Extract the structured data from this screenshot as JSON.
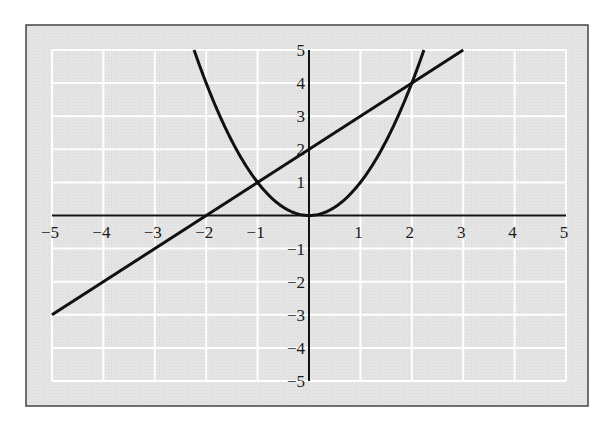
{
  "chart_data": {
    "type": "line",
    "title": "",
    "xlabel": "",
    "ylabel": "",
    "xlim": [
      -5,
      5
    ],
    "ylim": [
      -5,
      5
    ],
    "grid": true,
    "legend": null,
    "x_ticks": [
      "−5",
      "−4",
      "−3",
      "−2",
      "−1",
      "1",
      "2",
      "3",
      "4",
      "5"
    ],
    "y_ticks": [
      "5",
      "4",
      "3",
      "2",
      "1",
      "−1",
      "−2",
      "−3",
      "−4",
      "−5"
    ],
    "series": [
      {
        "name": "parabola y = x^2",
        "x": [
          -2.24,
          -2,
          -1.5,
          -1,
          -0.5,
          0,
          0.5,
          1,
          1.5,
          2,
          2.24
        ],
        "values": [
          5,
          4,
          2.25,
          1,
          0.25,
          0,
          0.25,
          1,
          2.25,
          4,
          5
        ]
      },
      {
        "name": "line y = x + 2",
        "x": [
          -5,
          -2,
          -1,
          0,
          2,
          3
        ],
        "values": [
          -3,
          0,
          1,
          2,
          4,
          5
        ]
      }
    ],
    "intersections": [
      {
        "x": -1,
        "y": 1
      },
      {
        "x": 2,
        "y": 4
      }
    ]
  },
  "colors": {
    "background": "#e4e4e4",
    "gridline": "#ffffff",
    "curve": "#111111",
    "frame": "#444444"
  }
}
